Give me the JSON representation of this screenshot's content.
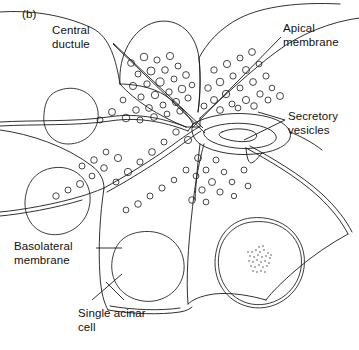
{
  "figure": {
    "panel_letter": "(b)",
    "background_color": "#ffffff",
    "ink_color": "#1a1a1a"
  },
  "labels": {
    "central_ductule": "Central\nductule",
    "apical_membrane": "Apical\nmembrane",
    "secretory_vesicles": "Secretory\nvesicles",
    "basolateral_membrane": "Basolateral\nmembrane",
    "single_acinar_cell": "Single acinar\ncell"
  },
  "structures": {
    "acinar_cells": 6,
    "nuclei": 4,
    "nucleolus_present": true,
    "lumen": "central-lumen",
    "ductule": "central-ductule"
  }
}
